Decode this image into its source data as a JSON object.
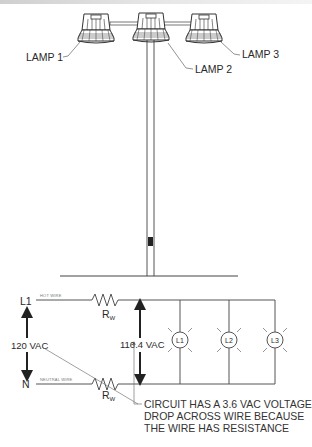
{
  "figure": {
    "lamps": [
      {
        "label": "LAMP 1"
      },
      {
        "label": "LAMP 2"
      },
      {
        "label": "LAMP 3"
      }
    ],
    "circuit": {
      "hot_terminal": "L1",
      "neutral_terminal": "N",
      "hot_wire_label": "HOT WIRE",
      "neutral_wire_label": "NEUTRAL WIRE",
      "resistor_label": "R",
      "resistor_subscript": "W",
      "source_voltage": "120 VAC",
      "load_voltage": "116.4 VAC",
      "loads": [
        {
          "label": "L1"
        },
        {
          "label": "L2"
        },
        {
          "label": "L3"
        }
      ],
      "note_lines": [
        "CIRCUIT HAS A 3.6 VAC VOLTAGE",
        "DROP ACROSS WIRE BECAUSE",
        "THE WIRE HAS RESISTANCE"
      ]
    },
    "colors": {
      "line": "#555555",
      "text": "#2a2a2a",
      "background": "#ffffff"
    }
  }
}
